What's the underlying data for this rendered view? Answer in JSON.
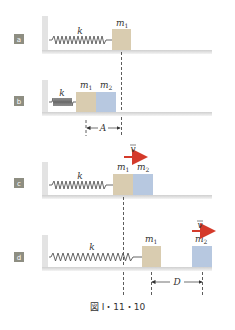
{
  "figure": {
    "caption": "図 I・11・10",
    "colors": {
      "m1_block": "#d9ccb0",
      "m2_block": "#b7c8e0",
      "badge": "#8e8e82",
      "arrow": "#d43a2a",
      "wall": "#e6e6e6",
      "spring": "#555555"
    },
    "panels": [
      {
        "id": "a",
        "badge": "a",
        "spring_label": "k",
        "blocks": [
          {
            "label": "m",
            "sub": "1"
          }
        ]
      },
      {
        "id": "b",
        "badge": "b",
        "spring_label": "k",
        "blocks": [
          {
            "label": "m",
            "sub": "1"
          },
          {
            "label": "m",
            "sub": "2"
          }
        ],
        "dimension": "A"
      },
      {
        "id": "c",
        "badge": "c",
        "spring_label": "k",
        "blocks": [
          {
            "label": "m",
            "sub": "1"
          },
          {
            "label": "m",
            "sub": "2"
          }
        ],
        "velocity": "v"
      },
      {
        "id": "d",
        "badge": "d",
        "spring_label": "k",
        "blocks": [
          {
            "label": "m",
            "sub": "1"
          },
          {
            "label": "m",
            "sub": "2"
          }
        ],
        "velocity": "v",
        "dimension": "D"
      }
    ]
  }
}
